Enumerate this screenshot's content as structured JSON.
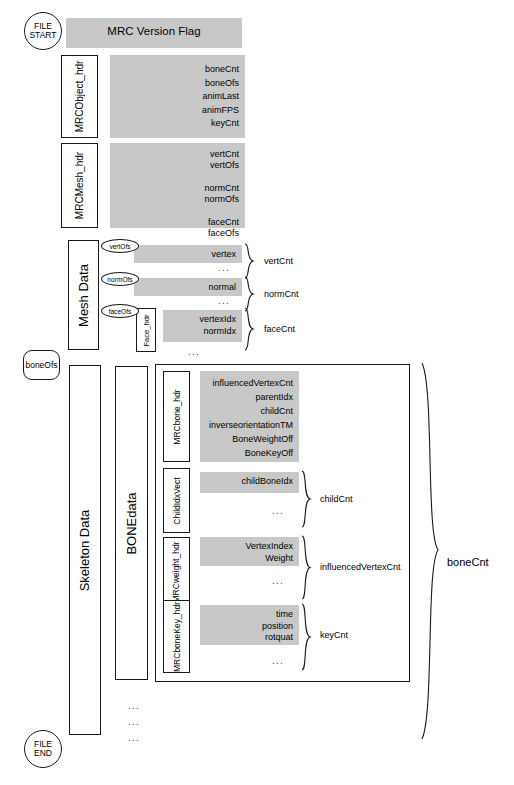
{
  "diagram": {
    "title": "MRC Version Flag",
    "markers": {
      "file_start_line1": "FILE",
      "file_start_line2": "START",
      "file_end_line1": "FILE",
      "file_end_line2": "END",
      "bone_ofs": "boneOfs"
    },
    "version_flag": {
      "label": "MRC Version Flag"
    },
    "object_header": {
      "label": "MRCObject_hdr",
      "fields": "boneCnt\nboneOfs\nanimLast\nanimFPS\nkeyCnt"
    },
    "mesh_header": {
      "label": "MRCMesh_hdr",
      "fields": "vertCnt\nvertOfs\n\nnormCnt\nnormOfs\n\nfaceCnt\nfaceOfs"
    },
    "mesh_data": {
      "label": "Mesh Data",
      "offsets": {
        "vert": "vertOfs",
        "norm": "normOfs",
        "face": "faceOfs"
      },
      "rows": [
        {
          "name": "vertex",
          "count": "vertCnt",
          "ellipsis": "..."
        },
        {
          "name": "normal",
          "count": "normCnt",
          "ellipsis": "..."
        }
      ],
      "face": {
        "label": "Face_hdr",
        "fields": "vertexIdx\nnormIdx",
        "count": "faceCnt",
        "ellipsis": "..."
      }
    },
    "skeleton_data": {
      "label": "Skeleton Data",
      "bone_data_label": "BONEdata",
      "bone_count": "boneCnt",
      "blocks": [
        {
          "label": "MRCbone_hdr",
          "fields": "influencedVertexCnt\nparentIdx\nchildCnt\ninverseorientationTM\nBoneWeightOff\nBoneKeyOff",
          "count": "",
          "ellipsis": ""
        },
        {
          "label": "ChildIdxVect",
          "fields": "childBoneIdx",
          "count": "childCnt",
          "ellipsis": "..."
        },
        {
          "label": "MRCweight_hdr",
          "fields": "VertexIndex\nWeight",
          "count": "influencedVertexCnt",
          "ellipsis": "..."
        },
        {
          "label": "MRCboneKey_hdr",
          "fields": "time\nposition\nrotquat",
          "count": "keyCnt",
          "ellipsis": "..."
        }
      ],
      "repeat_dots": [
        "...",
        "...",
        "..."
      ]
    },
    "colors": {
      "block_fill": "#c8c8c8",
      "stroke": "#1a1a1a",
      "background": "#ffffff"
    }
  }
}
